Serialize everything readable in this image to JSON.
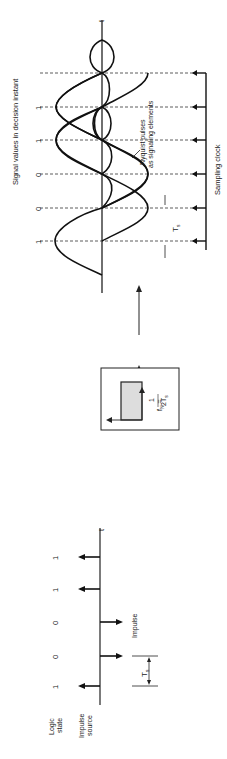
{
  "top_section": {
    "title": "Signal values in decision instant",
    "values": [
      "1",
      "0",
      "0",
      "1",
      "1"
    ],
    "axis_label": "t",
    "pulse_label_1": "Nyquist pulses",
    "pulse_label_2": "as signaling elements",
    "ts_label": "T",
    "ts_sub": "s",
    "clock_label": "Sampling clock"
  },
  "filter_block": {
    "formula_lhs": "f",
    "formula_sub": "N",
    "formula_eq": "=",
    "formula_num": "1",
    "formula_den": "2T",
    "formula_den_sub": "s"
  },
  "bottom_section": {
    "logic_label_1": "Logic",
    "logic_label_2": "state",
    "source_label_1": "Impulse",
    "source_label_2": "source",
    "states": [
      "1",
      "0",
      "0",
      "1",
      "1"
    ],
    "impulse_label": "Impulse",
    "ts_label": "T",
    "ts_sub": "s",
    "axis_label": "t"
  }
}
